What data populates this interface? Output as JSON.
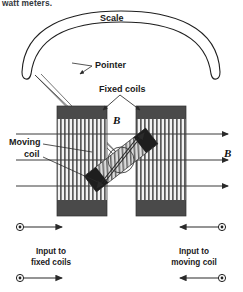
{
  "figure": {
    "name": "electrodynamometer-wattmeter-diagram",
    "caption_top": "watt meters.",
    "background": "#ffffff",
    "ink": "#1a1a1a",
    "coil_fill": "#e8e8e8",
    "coil_cap": "#4a4a4a",
    "hatch": "#555555"
  },
  "labels": {
    "scale": "Scale",
    "pointer": "Pointer",
    "fixed_coils": "Fixed coils",
    "moving_coil": "Moving\ncoil",
    "moving_coil_line1": "Moving",
    "moving_coil_line2": "coil",
    "field_b_inner": "B",
    "field_b_outer": "B",
    "input_fixed_line1": "Input to",
    "input_fixed_line2": "fixed coils",
    "input_moving_line1": "Input to",
    "input_moving_line2": "moving coil"
  },
  "parts": {
    "scale_arc": "curved-band-scale",
    "pointer_wedge": "tapered-pointer",
    "fixed_coil_left": "left-fixed-coil-block",
    "fixed_coil_right": "right-fixed-coil-block",
    "moving_coil_body": "tilted-moving-coil",
    "pivot": "pivot-circle",
    "field_lines_count": 3,
    "terminal_count": 4
  },
  "terminals": {
    "fixed_top": "terminal-fixed-top",
    "fixed_bottom": "terminal-fixed-bottom",
    "moving_top": "terminal-moving-top",
    "moving_bottom": "terminal-moving-bottom"
  }
}
